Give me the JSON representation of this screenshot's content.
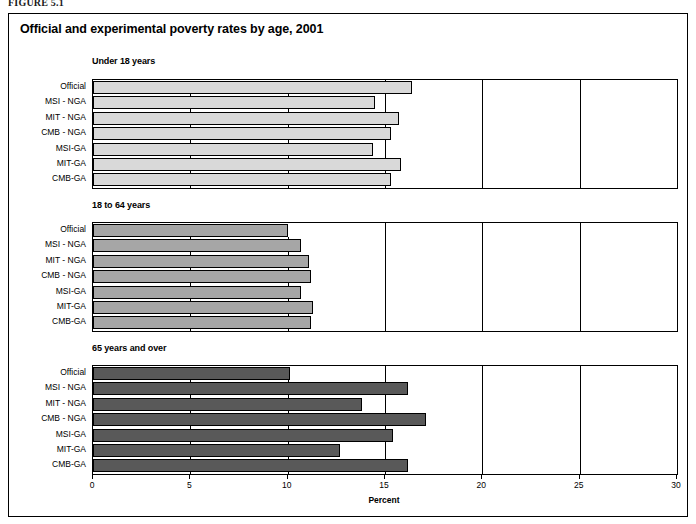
{
  "figure": {
    "label": "FIGURE 5.1",
    "title": "Official and experimental poverty rates by age, 2001"
  },
  "axis": {
    "title": "Percent",
    "ticks": [
      0,
      5,
      10,
      15,
      20,
      25,
      30
    ],
    "min": 0,
    "max": 30
  },
  "chart_data": {
    "type": "bar",
    "orientation": "horizontal",
    "title": "Official and experimental poverty rates by age, 2001",
    "xlabel": "Percent",
    "ylabel": "",
    "xlim": [
      0,
      30
    ],
    "xticks": [
      0,
      5,
      10,
      15,
      20,
      25,
      30
    ],
    "grid": true,
    "legend": "none",
    "categories": [
      "Official",
      "MSI - NGA",
      "MIT - NGA",
      "CMB - NGA",
      "MSI-GA",
      "MIT-GA",
      "CMB-GA"
    ],
    "panels": [
      {
        "title": "Under 18 years",
        "color": "#d9d9d9",
        "values": [
          16.4,
          14.5,
          15.7,
          15.3,
          14.4,
          15.8,
          15.3
        ]
      },
      {
        "title": "18 to 64 years",
        "color": "#a6a6a6",
        "values": [
          10.0,
          10.7,
          11.1,
          11.2,
          10.7,
          11.3,
          11.2
        ]
      },
      {
        "title": "65 years and over",
        "color": "#595959",
        "values": [
          10.1,
          16.2,
          13.8,
          17.1,
          15.4,
          12.7,
          16.2
        ]
      }
    ]
  }
}
